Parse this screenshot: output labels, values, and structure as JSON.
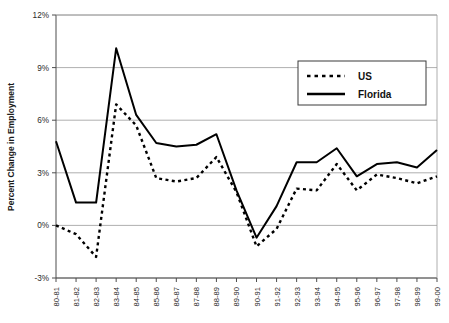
{
  "chart_data": {
    "type": "line",
    "title": "",
    "xlabel": "",
    "ylabel": "Percent Change in Employment",
    "ylim": [
      -3,
      12
    ],
    "yticks": [
      -3,
      0,
      3,
      6,
      9,
      12
    ],
    "ytick_labels": [
      "-3%",
      "0%",
      "3%",
      "6%",
      "9%",
      "12%"
    ],
    "grid": true,
    "legend_position": "upper right",
    "categories": [
      "80-81",
      "81-82",
      "82-83",
      "83-84",
      "84-85",
      "85-86",
      "86-87",
      "87-88",
      "88-89",
      "89-90",
      "90-91",
      "91-92",
      "92-93",
      "93-94",
      "94-95",
      "95-96",
      "96-97",
      "97-98",
      "98-99",
      "99-00"
    ],
    "series": [
      {
        "name": "US",
        "style": "dotted",
        "color": "#000000",
        "values": [
          0.0,
          -0.5,
          -1.1,
          -1.8,
          6.9,
          5.7,
          4.2,
          3.1,
          2.7,
          2.5,
          2.5,
          2.7,
          3.3,
          3.9,
          4.0,
          2.4,
          -1.2,
          -1.1,
          -0.2,
          0.9
        ]
      },
      {
        "name": "Florida",
        "style": "solid",
        "color": "#000000",
        "values": [
          4.8,
          1.3,
          1.3,
          10.1,
          6.3,
          5.3,
          4.7,
          4.5,
          4.55,
          4.7,
          5.2,
          2.5,
          -0.7,
          0.0,
          1.5,
          3.6,
          3.6,
          3.6,
          4.4,
          3.9
        ]
      }
    ],
    "series_us_full": [
      0.0,
      -0.5,
      -1.8,
      6.9,
      5.7,
      2.7,
      2.5,
      2.7,
      3.9,
      1.9,
      -1.2,
      -0.2,
      2.1,
      2.0,
      3.5,
      2.0,
      2.9,
      2.7,
      2.4,
      2.8
    ],
    "series_florida_full": [
      4.8,
      1.3,
      1.3,
      10.1,
      6.3,
      4.7,
      4.5,
      4.6,
      5.2,
      2.0,
      -0.7,
      1.1,
      3.6,
      3.6,
      4.4,
      2.8,
      3.5,
      3.6,
      3.3,
      4.3
    ]
  },
  "legend": {
    "items": [
      {
        "label": "US",
        "style": "dotted"
      },
      {
        "label": "Florida",
        "style": "solid"
      }
    ]
  },
  "axes": {
    "y_title": "Percent Change in Employment",
    "y_labels": [
      "12%",
      "9%",
      "6%",
      "3%",
      "0%",
      "-3%"
    ],
    "x_labels": [
      "80-81",
      "81-82",
      "82-83",
      "83-84",
      "84-85",
      "85-86",
      "86-87",
      "87-88",
      "88-89",
      "89-90",
      "90-91",
      "91-92",
      "92-93",
      "93-94",
      "94-95",
      "95-96",
      "96-97",
      "97-98",
      "98-99",
      "99-00"
    ]
  }
}
